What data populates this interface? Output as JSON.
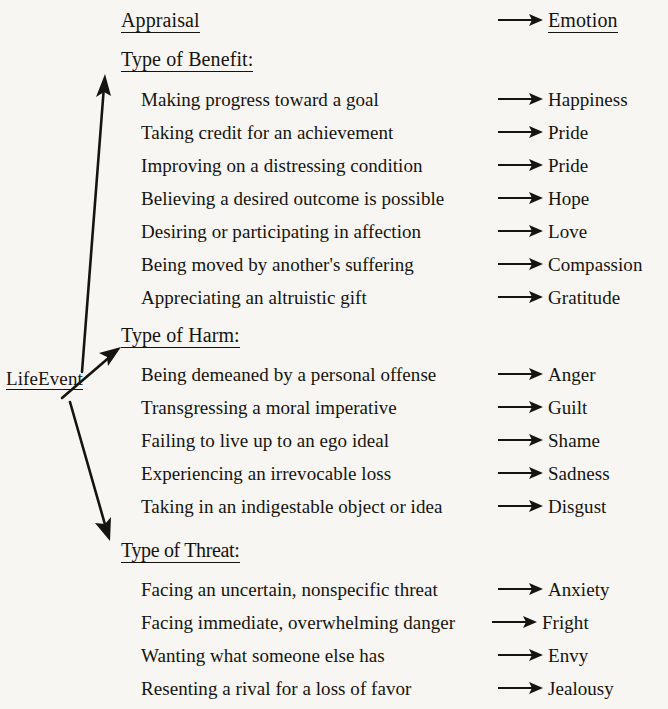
{
  "figure": {
    "root_node": "LifeEvent",
    "columns": {
      "left_header": "Appraisal",
      "right_header": "Emotion"
    },
    "arrow_glyph": "→",
    "ink_color": "#16140f",
    "page_color": "#f7f6f2",
    "sections": [
      {
        "header": "Type of Benefit:",
        "rows": [
          {
            "appraisal": "Making progress toward a goal",
            "emotion": "Happiness"
          },
          {
            "appraisal": "Taking credit for an achievement",
            "emotion": "Pride"
          },
          {
            "appraisal": "Improving on a distressing condition",
            "emotion": "Pride"
          },
          {
            "appraisal": "Believing a desired outcome is possible",
            "emotion": "Hope"
          },
          {
            "appraisal": "Desiring or participating in affection",
            "emotion": "Love"
          },
          {
            "appraisal": "Being moved by another's suffering",
            "emotion": "Compassion"
          },
          {
            "appraisal": "Appreciating an altruistic gift",
            "emotion": "Gratitude"
          }
        ]
      },
      {
        "header": "Type of Harm:",
        "rows": [
          {
            "appraisal": "Being demeaned by a personal offense",
            "emotion": "Anger"
          },
          {
            "appraisal": "Transgressing a moral imperative",
            "emotion": "Guilt"
          },
          {
            "appraisal": "Failing to live up to an ego ideal",
            "emotion": "Shame"
          },
          {
            "appraisal": "Experiencing an irrevocable loss",
            "emotion": "Sadness"
          },
          {
            "appraisal": "Taking in an indigestable object or idea",
            "emotion": "Disgust"
          }
        ]
      },
      {
        "header": "Type of Threat:",
        "rows": [
          {
            "appraisal": "Facing an uncertain, nonspecific threat",
            "emotion": "Anxiety"
          },
          {
            "appraisal": "Facing immediate, overwhelming danger",
            "emotion": "Fright"
          },
          {
            "appraisal": "Wanting what someone else has",
            "emotion": "Envy"
          },
          {
            "appraisal": "Resenting a rival for a loss of favor",
            "emotion": "Jealousy"
          }
        ]
      }
    ]
  }
}
